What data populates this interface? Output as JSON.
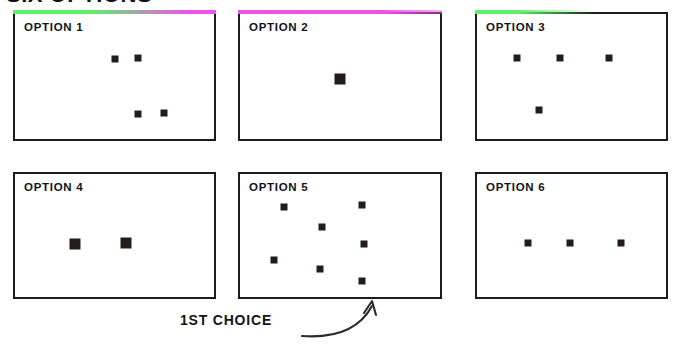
{
  "page": {
    "title": "SIX OPTIONS",
    "background_color": "#ffffff",
    "ink_color": "#1c1c1c",
    "marker_color": "#241c18"
  },
  "accents": {
    "green": "#5ef06a",
    "magenta": "#f04ff0"
  },
  "annotation": {
    "label": "1ST CHOICE",
    "points_to": "OPTION 5",
    "arrow_icon": "curved-arrow-up-right-icon"
  },
  "cards": [
    {
      "id": "option-1",
      "label": "OPTION 1",
      "accent": "gradient-green-magenta",
      "marker_count": 4,
      "marker_size": 7,
      "frame": {
        "x": 13,
        "y": 12,
        "w": 203,
        "h": 129
      },
      "markers": [
        {
          "x": 0.5,
          "y": 0.36
        },
        {
          "x": 0.62,
          "y": 0.35
        },
        {
          "x": 0.62,
          "y": 0.8
        },
        {
          "x": 0.75,
          "y": 0.79
        }
      ]
    },
    {
      "id": "option-2",
      "label": "OPTION 2",
      "accent": "solid-magenta",
      "marker_count": 1,
      "marker_size": 11,
      "frame": {
        "x": 238,
        "y": 12,
        "w": 204,
        "h": 129
      },
      "markers": [
        {
          "x": 0.5,
          "y": 0.52
        }
      ]
    },
    {
      "id": "option-3",
      "label": "OPTION 3",
      "accent": "gradient-green-fade",
      "marker_count": 4,
      "marker_size": 7,
      "frame": {
        "x": 475,
        "y": 12,
        "w": 193,
        "h": 129
      },
      "markers": [
        {
          "x": 0.21,
          "y": 0.35
        },
        {
          "x": 0.44,
          "y": 0.35
        },
        {
          "x": 0.7,
          "y": 0.35
        },
        {
          "x": 0.33,
          "y": 0.77
        }
      ]
    },
    {
      "id": "option-4",
      "label": "OPTION 4",
      "accent": "none",
      "marker_count": 2,
      "marker_size": 11,
      "frame": {
        "x": 13,
        "y": 172,
        "w": 203,
        "h": 127
      },
      "markers": [
        {
          "x": 0.3,
          "y": 0.57
        },
        {
          "x": 0.56,
          "y": 0.56
        }
      ]
    },
    {
      "id": "option-5",
      "label": "OPTION 5",
      "accent": "none",
      "marker_count": 7,
      "marker_size": 7,
      "frame": {
        "x": 238,
        "y": 172,
        "w": 204,
        "h": 127
      },
      "markers": [
        {
          "x": 0.22,
          "y": 0.27
        },
        {
          "x": 0.61,
          "y": 0.25
        },
        {
          "x": 0.41,
          "y": 0.43
        },
        {
          "x": 0.62,
          "y": 0.57
        },
        {
          "x": 0.17,
          "y": 0.7
        },
        {
          "x": 0.4,
          "y": 0.77
        },
        {
          "x": 0.61,
          "y": 0.87
        }
      ]
    },
    {
      "id": "option-6",
      "label": "OPTION 6",
      "accent": "none",
      "marker_count": 3,
      "marker_size": 7,
      "frame": {
        "x": 475,
        "y": 172,
        "w": 193,
        "h": 127
      },
      "markers": [
        {
          "x": 0.27,
          "y": 0.56
        },
        {
          "x": 0.49,
          "y": 0.56
        },
        {
          "x": 0.76,
          "y": 0.56
        }
      ]
    }
  ]
}
